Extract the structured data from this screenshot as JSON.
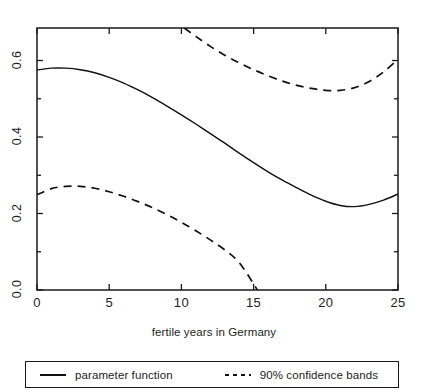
{
  "chart_data": {
    "type": "line",
    "title": "",
    "xlabel": "fertile years in Germany",
    "ylabel": "",
    "xlim": [
      0,
      25
    ],
    "ylim": [
      0.0,
      0.685
    ],
    "grid": false,
    "legend_position": "below-axes",
    "xticks": [
      0,
      5,
      10,
      15,
      20,
      25
    ],
    "xtick_labels": [
      "0",
      "5",
      "10",
      "15",
      "20",
      "25"
    ],
    "yticks": [
      0.0,
      0.2,
      0.4,
      0.6
    ],
    "ytick_labels": [
      "0.0",
      "0.2",
      "0.4",
      "0.6"
    ],
    "yminor_ticks": [
      0.1,
      0.3,
      0.5
    ],
    "series": [
      {
        "name": "parameter function",
        "style": "solid",
        "color": "#111111",
        "x": [
          0,
          1,
          2,
          3,
          4,
          5,
          6,
          7,
          8,
          9,
          10,
          11,
          12,
          13,
          14,
          15,
          16,
          17,
          18,
          19,
          20,
          21,
          22,
          23,
          24,
          25
        ],
        "values": [
          0.575,
          0.58,
          0.58,
          0.576,
          0.568,
          0.556,
          0.541,
          0.523,
          0.503,
          0.481,
          0.458,
          0.434,
          0.409,
          0.384,
          0.358,
          0.333,
          0.309,
          0.287,
          0.267,
          0.248,
          0.232,
          0.221,
          0.218,
          0.224,
          0.235,
          0.251
        ]
      },
      {
        "name": "90% confidence bands upper",
        "style": "dashed",
        "color": "#111111",
        "x": [
          10.2,
          11,
          12,
          13,
          14,
          15,
          16,
          17,
          18,
          19,
          20,
          21,
          22,
          23,
          24,
          25
        ],
        "values": [
          0.685,
          0.663,
          0.637,
          0.614,
          0.594,
          0.576,
          0.56,
          0.546,
          0.535,
          0.527,
          0.522,
          0.522,
          0.529,
          0.545,
          0.57,
          0.603
        ]
      },
      {
        "name": "90% confidence bands lower",
        "style": "dashed",
        "color": "#111111",
        "x": [
          0,
          1,
          2,
          3,
          4,
          5,
          6,
          7,
          8,
          9,
          10,
          11,
          12,
          13,
          14,
          15,
          15.25
        ],
        "values": [
          0.249,
          0.265,
          0.271,
          0.271,
          0.266,
          0.257,
          0.245,
          0.231,
          0.215,
          0.197,
          0.177,
          0.155,
          0.131,
          0.105,
          0.072,
          0.016,
          0.0
        ]
      }
    ]
  },
  "legend": {
    "entries": [
      {
        "label": "parameter function",
        "style": "solid"
      },
      {
        "label": "90% confidence bands",
        "style": "dashed"
      }
    ]
  },
  "colors": {
    "ink": "#111111",
    "background": "#ffffff"
  }
}
